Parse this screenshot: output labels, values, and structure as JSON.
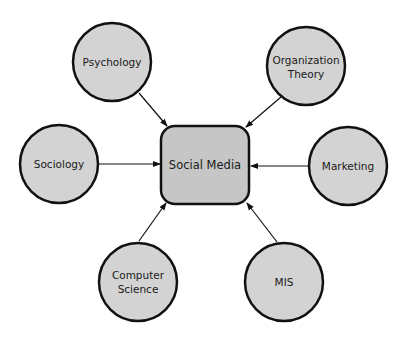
{
  "diagram": {
    "type": "hub-and-spoke",
    "colors": {
      "background": "#ffffff",
      "node_fill": "#d3d3d3",
      "center_fill": "#c6c6c6",
      "stroke": "#111111",
      "text": "#1a1a1a"
    },
    "center": {
      "label": "Social Media",
      "shape": "rounded-square"
    },
    "nodes": [
      {
        "id": "psychology",
        "label_lines": [
          "Psychology"
        ]
      },
      {
        "id": "organization-theory",
        "label_lines": [
          "Organization",
          "Theory"
        ]
      },
      {
        "id": "sociology",
        "label_lines": [
          "Sociology"
        ]
      },
      {
        "id": "marketing",
        "label_lines": [
          "Marketing"
        ]
      },
      {
        "id": "computer-science",
        "label_lines": [
          "Computer",
          "Science"
        ]
      },
      {
        "id": "mis",
        "label_lines": [
          "MIS"
        ]
      }
    ],
    "edges": [
      {
        "from": "psychology",
        "to": "social-media",
        "arrow": "end"
      },
      {
        "from": "organization-theory",
        "to": "social-media",
        "arrow": "end"
      },
      {
        "from": "sociology",
        "to": "social-media",
        "arrow": "end"
      },
      {
        "from": "marketing",
        "to": "social-media",
        "arrow": "end"
      },
      {
        "from": "computer-science",
        "to": "social-media",
        "arrow": "end"
      },
      {
        "from": "mis",
        "to": "social-media",
        "arrow": "end"
      }
    ]
  }
}
